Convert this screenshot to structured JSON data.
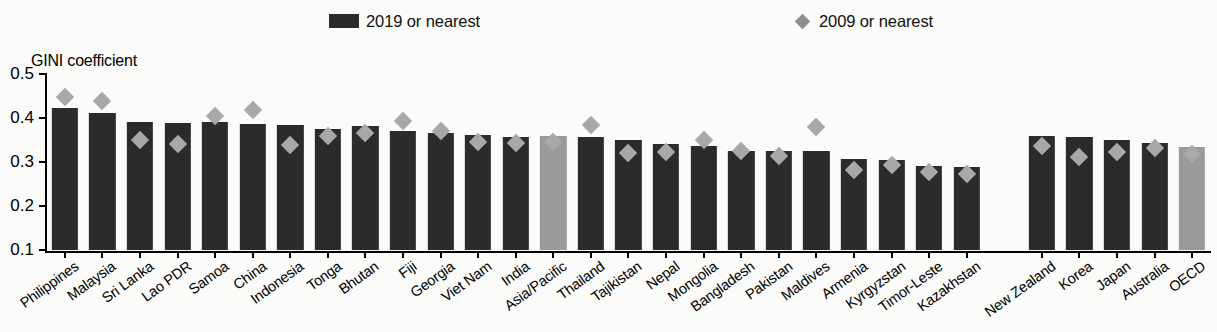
{
  "legend": {
    "series_2019": {
      "label": "2019 or nearest",
      "marker": "bar-swatch-icon",
      "color": "#2b2b2b"
    },
    "series_2009": {
      "label": "2009 or nearest",
      "marker": "diamond-marker-icon",
      "color": "#8f8f8f"
    }
  },
  "axis": {
    "y_title": "GINI coefficient",
    "ticks": [
      "0.5",
      "0.4",
      "0.3",
      "0.2",
      "0.1"
    ]
  },
  "chart_data": {
    "type": "bar",
    "title": "",
    "subtitle": "",
    "xlabel": "",
    "ylabel": "GINI coefficient",
    "ylim": [
      0.1,
      0.5
    ],
    "yticks": [
      0.1,
      0.2,
      0.3,
      0.4,
      0.5
    ],
    "grid": false,
    "legend_position": "top",
    "categories": [
      "Philippines",
      "Malaysia",
      "Sri Lanka",
      "Lao PDR",
      "Samoa",
      "China",
      "Indonesia",
      "Tonga",
      "Bhutan",
      "Fiji",
      "Georgia",
      "Viet Nam",
      "India",
      "Asia/Pacific",
      "Thailand",
      "Tajikistan",
      "Nepal",
      "Mongolia",
      "Bangladesh",
      "Pakistan",
      "Maldives",
      "Armenia",
      "Kyrgyzstan",
      "Timor-Leste",
      "Kazakhstan",
      "",
      "New Zealand",
      "Korea",
      "Japan",
      "Australia",
      "OECD"
    ],
    "aggregate_categories": [
      "Asia/Pacific",
      "OECD"
    ],
    "series": [
      {
        "name": "2019 or nearest",
        "type": "bar",
        "color": "#2b2b2b",
        "values": [
          0.423,
          0.411,
          0.392,
          0.388,
          0.391,
          0.387,
          0.384,
          0.376,
          0.382,
          0.371,
          0.365,
          0.361,
          0.357,
          0.358,
          0.357,
          0.349,
          0.34,
          0.336,
          0.326,
          0.325,
          0.324,
          0.306,
          0.304,
          0.29,
          0.288,
          null,
          0.359,
          0.357,
          0.35,
          0.344,
          0.334
        ]
      },
      {
        "name": "2009 or nearest",
        "type": "scatter",
        "color": "#a8a8a8",
        "values": [
          0.464,
          0.455,
          0.366,
          0.356,
          0.421,
          0.434,
          0.354,
          0.376,
          0.382,
          0.409,
          0.387,
          0.361,
          0.359,
          0.362,
          0.401,
          0.336,
          0.338,
          0.366,
          0.34,
          0.329,
          0.395,
          0.297,
          0.31,
          0.293,
          0.288,
          null,
          0.352,
          0.327,
          0.338,
          0.348,
          0.334
        ]
      }
    ]
  }
}
